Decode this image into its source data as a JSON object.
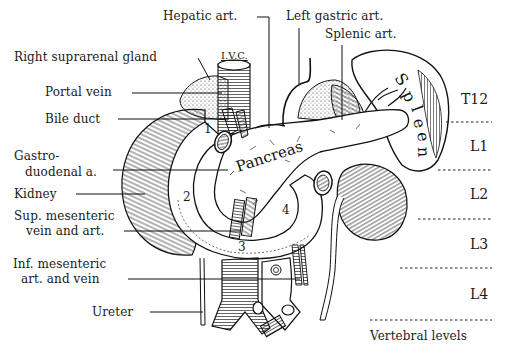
{
  "figure": {
    "labels_left": [
      {
        "id": "right-suprarenal-gland",
        "text": "Right suprarenal gland"
      },
      {
        "id": "portal-vein",
        "text": "Portal vein"
      },
      {
        "id": "bile-duct",
        "text": "Bile duct"
      },
      {
        "id": "gastroduodenal-a",
        "line1": "Gastro-",
        "line2": "duodenal a."
      },
      {
        "id": "kidney",
        "text": "Kidney"
      },
      {
        "id": "sup-mesenteric",
        "line1": "Sup. mesenteric",
        "line2": "vein and art."
      },
      {
        "id": "inf-mesenteric",
        "line1": "Inf. mesenteric",
        "line2": "art. and vein"
      },
      {
        "id": "ureter",
        "text": "Ureter"
      }
    ],
    "labels_top": [
      {
        "id": "hepatic-art",
        "text": "Hepatic art."
      },
      {
        "id": "ivc",
        "text": "I.V.C."
      },
      {
        "id": "left-gastric-art",
        "text": "Left gastric art."
      },
      {
        "id": "splenic-art",
        "text": "Splenic art."
      }
    ],
    "organ_labels": {
      "pancreas": "Pancreas",
      "spleen": "Spleen"
    },
    "duodenum_parts": [
      "1",
      "2",
      "3",
      "4"
    ],
    "vertebral_levels": {
      "levels": [
        "T12",
        "L1",
        "L2",
        "L3",
        "L4"
      ],
      "caption": "Vertebral levels"
    }
  }
}
